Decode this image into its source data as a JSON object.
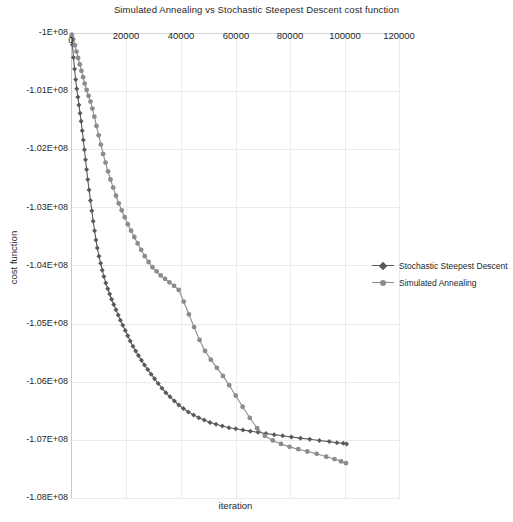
{
  "chart_data": {
    "type": "line",
    "title": "Simulated Annealing vs Stochastic Steepest Descent cost function",
    "xlabel": "iteration",
    "ylabel": "cost function",
    "xlim": [
      0,
      120000
    ],
    "ylim": [
      -108000000,
      -100000000
    ],
    "grid": true,
    "x_axis_position": "top",
    "xticks": [
      0,
      20000,
      40000,
      60000,
      80000,
      100000,
      120000
    ],
    "xtick_labels": [
      "0",
      "20000",
      "40000",
      "60000",
      "80000",
      "100000",
      "120000"
    ],
    "yticks": [
      -100000000,
      -101000000,
      -102000000,
      -103000000,
      -104000000,
      -105000000,
      -106000000,
      -107000000,
      -108000000
    ],
    "ytick_labels": [
      "-1E+08",
      "-1.01E+08",
      "-1.02E+08",
      "-1.03E+08",
      "-1.04E+08",
      "-1.05E+08",
      "-1.06E+08",
      "-1.07E+08",
      "-1.08E+08"
    ],
    "legend_position": "right",
    "series": [
      {
        "name": "Stochastic Steepest Descent",
        "color": "#595959",
        "marker": "diamond",
        "x": [
          200,
          500,
          900,
          1300,
          1700,
          2100,
          2500,
          2900,
          3300,
          3700,
          4100,
          4500,
          4900,
          5300,
          5700,
          6100,
          6600,
          7100,
          7600,
          8100,
          8600,
          9100,
          9600,
          10200,
          10800,
          11400,
          12000,
          12700,
          13400,
          14100,
          14800,
          15600,
          16400,
          17200,
          18000,
          18900,
          19800,
          20700,
          21600,
          22600,
          23600,
          24600,
          25700,
          26800,
          28000,
          29200,
          30500,
          31800,
          33200,
          34600,
          36100,
          37700,
          39300,
          41000,
          42800,
          44700,
          46600,
          48600,
          50700,
          52900,
          55200,
          57600,
          60100,
          62700,
          65400,
          68200,
          71100,
          74100,
          77200,
          80400,
          83700,
          87100,
          90600,
          94200,
          97000,
          99300,
          100500
        ],
        "y": [
          -100050000,
          -100200000,
          -100420000,
          -100620000,
          -100800000,
          -100960000,
          -101100000,
          -101240000,
          -101380000,
          -101520000,
          -101680000,
          -101840000,
          -102010000,
          -102180000,
          -102350000,
          -102520000,
          -102700000,
          -102880000,
          -103060000,
          -103240000,
          -103400000,
          -103560000,
          -103700000,
          -103840000,
          -103960000,
          -104080000,
          -104190000,
          -104300000,
          -104400000,
          -104490000,
          -104580000,
          -104670000,
          -104760000,
          -104850000,
          -104940000,
          -105030000,
          -105120000,
          -105210000,
          -105300000,
          -105390000,
          -105470000,
          -105550000,
          -105630000,
          -105710000,
          -105790000,
          -105870000,
          -105950000,
          -106030000,
          -106110000,
          -106190000,
          -106260000,
          -106330000,
          -106400000,
          -106460000,
          -106520000,
          -106570000,
          -106620000,
          -106660000,
          -106700000,
          -106730000,
          -106760000,
          -106790000,
          -106810000,
          -106830000,
          -106850000,
          -106870000,
          -106890000,
          -106910000,
          -106930000,
          -106950000,
          -106970000,
          -106990000,
          -107010000,
          -107030000,
          -107050000,
          -107060000,
          -107070000
        ]
      },
      {
        "name": "Simulated Annealing",
        "color": "#8c8c8c",
        "marker": "circle",
        "x": [
          300,
          800,
          1400,
          2000,
          2600,
          3200,
          3800,
          4400,
          5000,
          5700,
          6400,
          7100,
          7800,
          8500,
          9300,
          10100,
          10900,
          11700,
          12600,
          13500,
          14400,
          15400,
          16400,
          17400,
          18500,
          19600,
          20700,
          21900,
          23100,
          24300,
          25600,
          26900,
          28300,
          29700,
          31200,
          32700,
          34300,
          35900,
          37600,
          39300,
          41100,
          43000,
          44900,
          46900,
          48900,
          51000,
          53200,
          55400,
          57700,
          60100,
          62600,
          65200,
          67900,
          70700,
          73600,
          76600,
          79700,
          82900,
          86200,
          89600,
          93100,
          96100,
          98500,
          100300
        ],
        "y": [
          -100030000,
          -100110000,
          -100210000,
          -100320000,
          -100430000,
          -100540000,
          -100650000,
          -100760000,
          -100870000,
          -100980000,
          -101080000,
          -101180000,
          -101300000,
          -101440000,
          -101600000,
          -101760000,
          -101920000,
          -102080000,
          -102230000,
          -102380000,
          -102520000,
          -102660000,
          -102800000,
          -102930000,
          -103050000,
          -103170000,
          -103290000,
          -103400000,
          -103510000,
          -103620000,
          -103730000,
          -103840000,
          -103940000,
          -104030000,
          -104100000,
          -104170000,
          -104230000,
          -104290000,
          -104350000,
          -104420000,
          -104620000,
          -104840000,
          -105060000,
          -105280000,
          -105470000,
          -105620000,
          -105760000,
          -105900000,
          -106060000,
          -106240000,
          -106430000,
          -106620000,
          -106800000,
          -106930000,
          -107010000,
          -107070000,
          -107120000,
          -107160000,
          -107200000,
          -107240000,
          -107290000,
          -107330000,
          -107370000,
          -107400000
        ]
      }
    ]
  }
}
